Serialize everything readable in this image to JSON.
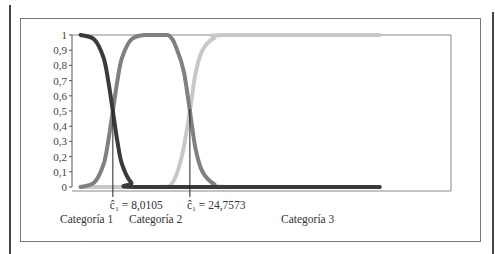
{
  "chart_data": {
    "type": "line",
    "title": "",
    "xlabel": "",
    "ylabel": "",
    "ylim": [
      0,
      1
    ],
    "xlim": [
      0,
      80
    ],
    "y_ticks": [
      "0",
      "0,1",
      "0,2",
      "0,3",
      "0,4",
      "0,5",
      "0,6",
      "0,7",
      "0,8",
      "0,9",
      "1"
    ],
    "grid": false,
    "legend": "none",
    "series": [
      {
        "name": "Categoría 1",
        "color": "#3a3a3a",
        "shape": "decreasing-sigmoid",
        "x": [
          1,
          4,
          6,
          7,
          8.0105,
          9,
          10,
          12,
          15,
          66
        ],
        "values": [
          1,
          0.97,
          0.85,
          0.7,
          0.5,
          0.3,
          0.15,
          0.03,
          0,
          0
        ]
      },
      {
        "name": "Categoría 2",
        "color": "#808080",
        "shape": "plateau",
        "x": [
          1,
          4,
          6,
          7,
          8.0105,
          9,
          10,
          12,
          15,
          20,
          22,
          23.5,
          24.7573,
          26,
          27.5,
          30,
          33,
          66
        ],
        "values": [
          0,
          0.03,
          0.15,
          0.3,
          0.5,
          0.7,
          0.85,
          0.97,
          1,
          1,
          0.9,
          0.75,
          0.5,
          0.25,
          0.1,
          0.02,
          0,
          0
        ]
      },
      {
        "name": "Categoría 3",
        "color": "#c8c8c8",
        "shape": "increasing-sigmoid",
        "x": [
          1,
          18,
          21,
          23,
          24.7573,
          26,
          27.5,
          30,
          33,
          66
        ],
        "values": [
          0,
          0,
          0.03,
          0.2,
          0.5,
          0.75,
          0.9,
          0.98,
          1,
          1
        ]
      }
    ],
    "annotations": [
      {
        "text": "ĉ₁ = 8,0105",
        "x": 8.0105
      },
      {
        "text": "ĉ₁ = 24,7573",
        "x": 24.7573
      }
    ],
    "region_labels": [
      "Categoría 1",
      "Categoría 2",
      "Categoría 3"
    ]
  }
}
